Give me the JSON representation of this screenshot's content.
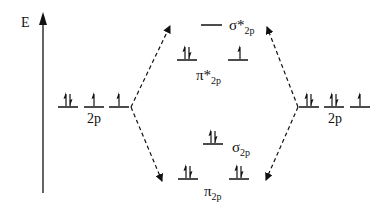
{
  "diagram": {
    "type": "molecular-orbital-diagram",
    "axis": {
      "label": "E"
    },
    "left_atom": {
      "label": "2p",
      "orbitals": [
        {
          "electrons": "up-down"
        },
        {
          "electrons": "up"
        },
        {
          "electrons": "up"
        }
      ]
    },
    "right_atom": {
      "label": "2p",
      "orbitals": [
        {
          "electrons": "up-down"
        },
        {
          "electrons": "up-down"
        },
        {
          "electrons": "up"
        }
      ]
    },
    "molecular_orbitals": {
      "sigma_star": {
        "symbol": "σ*",
        "subscript": "2p",
        "electrons": "none"
      },
      "pi_star": {
        "symbol": "π*",
        "subscript": "2p",
        "electrons": [
          "up-down",
          "up"
        ]
      },
      "sigma": {
        "symbol": "σ",
        "subscript": "2p",
        "electrons": "up-down"
      },
      "pi": {
        "symbol": "π",
        "subscript": "2p",
        "electrons": [
          "up-down",
          "up-down"
        ]
      }
    },
    "colors": {
      "ink": "#111111",
      "background": "#ffffff"
    }
  }
}
